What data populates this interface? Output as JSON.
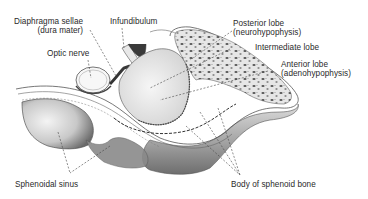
{
  "figure": {
    "background": "#ffffff",
    "ink_color": "#2a2a2a"
  },
  "labels": {
    "diaphragma": {
      "line1": "Diaphragma sellae",
      "line2": "(dura mater)"
    },
    "infundibulum": {
      "line1": "Infundibulum"
    },
    "optic_nerve": {
      "line1": "Optic nerve"
    },
    "posterior_lobe": {
      "line1": "Posterior lobe",
      "line2": "(neurohypophysis)"
    },
    "intermediate_lobe": {
      "line1": "Intermediate lobe"
    },
    "anterior_lobe": {
      "line1": "Anterior lobe",
      "line2": "(adenohypophysis)"
    },
    "sphenoidal_sinus": {
      "line1": "Sphenoidal sinus"
    },
    "body_sphenoid": {
      "line1": "Body of sphenoid bone"
    }
  }
}
